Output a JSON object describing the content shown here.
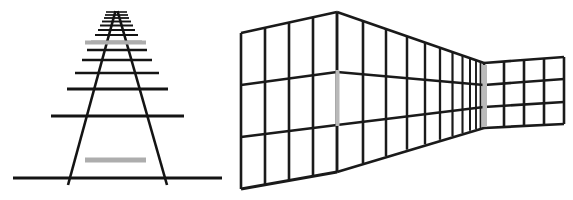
{
  "figure": {
    "background_color": "#ffffff",
    "line_color": "#141414",
    "gray_bar_color": "#adadad",
    "caption": "",
    "width": 573,
    "height": 200
  },
  "left_panel": {
    "name": "railroad-track-ponzo-illusion",
    "description": "Converging railroad tracks with two equal horizontal gray bars",
    "vanishing_point": {
      "x": 115,
      "y": 10
    },
    "rails": [
      {
        "name": "left-rail",
        "x1": 115.5,
        "y1": 11,
        "x2": 68,
        "y2": 185
      },
      {
        "name": "right-rail",
        "x1": 117.5,
        "y1": 11,
        "x2": 167,
        "y2": 185
      }
    ],
    "ties": [
      {
        "y": 12,
        "x1": 106,
        "x2": 127,
        "w": 1.6
      },
      {
        "y": 15,
        "x1": 105,
        "x2": 128,
        "w": 1.7
      },
      {
        "y": 18,
        "x1": 104,
        "x2": 129,
        "w": 1.8
      },
      {
        "y": 21.5,
        "x1": 102,
        "x2": 131,
        "w": 1.9
      },
      {
        "y": 25.5,
        "x1": 100,
        "x2": 133,
        "w": 2.0
      },
      {
        "y": 30,
        "x1": 98,
        "x2": 135,
        "w": 2.1
      },
      {
        "y": 35,
        "x1": 95,
        "x2": 138,
        "w": 2.2
      },
      {
        "y": 42,
        "x1": 91,
        "x2": 142,
        "w": 2.3
      },
      {
        "y": 50,
        "x1": 87,
        "x2": 147,
        "w": 2.4
      },
      {
        "y": 60,
        "x1": 82,
        "x2": 152,
        "w": 2.5
      },
      {
        "y": 73,
        "x1": 75,
        "x2": 159,
        "w": 2.6
      },
      {
        "y": 89,
        "x1": 67,
        "x2": 168,
        "w": 2.8
      },
      {
        "y": 116,
        "x1": 51,
        "x2": 184,
        "w": 3.0
      },
      {
        "y": 178,
        "x1": 13,
        "x2": 222,
        "w": 3.2
      }
    ],
    "gray_bars": [
      {
        "name": "upper-gray-bar",
        "x": 85,
        "y": 40.5,
        "width": 61,
        "height": 4,
        "color": "#adadad"
      },
      {
        "name": "lower-gray-bar",
        "x": 85,
        "y": 157.5,
        "width": 61,
        "height": 5,
        "color": "#adadad"
      }
    ]
  },
  "right_panel": {
    "name": "corridor-perspective-illusion",
    "description": "Receding tiled corridor wall with two equal vertical gray bars",
    "near_corner": {
      "x": 107,
      "y": 12
    },
    "gray_bars": [
      {
        "name": "near-gray-bar",
        "x": 105.5,
        "y": 70,
        "width": 4,
        "height": 56,
        "color": "#b9b9b9"
      },
      {
        "name": "far-gray-bar",
        "x": 252.5,
        "y": 65,
        "width": 4.5,
        "height": 62,
        "color": "#b9b9b9"
      }
    ],
    "left_wall": {
      "columns": 4,
      "rows": 3,
      "top_left": {
        "x": 11,
        "y": 33
      },
      "top_right": {
        "x": 107,
        "y": 12
      },
      "bottom_left": {
        "x": 11,
        "y": 189
      },
      "bottom_right": {
        "x": 107,
        "y": 172
      }
    },
    "receding_wall": {
      "columns": 11,
      "rows": 3,
      "near_top": {
        "x": 107,
        "y": 12
      },
      "near_bottom": {
        "x": 107,
        "y": 172
      },
      "far_top": {
        "x": 254,
        "y": 63
      },
      "far_bottom": {
        "x": 254,
        "y": 128
      }
    },
    "far_wall": {
      "columns": 4,
      "rows": 3,
      "top_left": {
        "x": 254,
        "y": 63
      },
      "top_right": {
        "x": 334,
        "y": 57
      },
      "bottom_left": {
        "x": 254,
        "y": 128
      },
      "bottom_right": {
        "x": 334,
        "y": 124
      }
    }
  }
}
